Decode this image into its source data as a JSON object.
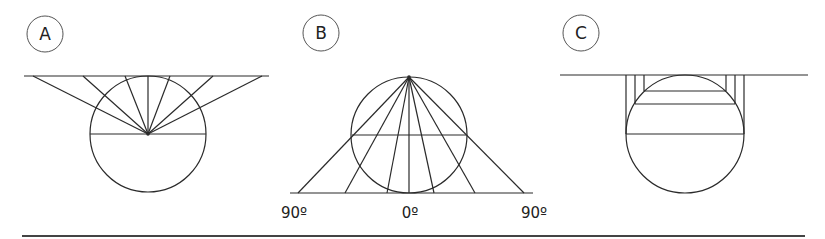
{
  "panels": [
    {
      "id": "A",
      "label": "A",
      "description": "Rays from circle center to horizontal line tangent at top"
    },
    {
      "id": "B",
      "label": "B",
      "description": "Rays from top point of circle to horizontal line tangent at bottom",
      "axis_labels": {
        "left": "90º",
        "center": "0º",
        "right": "90º"
      }
    },
    {
      "id": "C",
      "label": "C",
      "description": "Vertical parallel projection from circle to horizontal line tangent at top"
    }
  ],
  "colors": {
    "stroke": "#2a2a2a",
    "background": "#ffffff"
  }
}
